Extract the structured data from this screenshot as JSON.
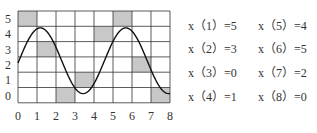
{
  "chart_data": {
    "type": "line",
    "title": "",
    "xlabel": "",
    "ylabel": "",
    "x_ticks": [
      "0",
      "1",
      "2",
      "3",
      "4",
      "5",
      "6",
      "7",
      "8"
    ],
    "y_ticks": [
      "0",
      "1",
      "2",
      "3",
      "4",
      "5"
    ],
    "xlim": [
      0,
      8
    ],
    "ylim": [
      0,
      6
    ],
    "grid": true,
    "curve": {
      "description": "sinusoidal curve",
      "points": [
        [
          0,
          2.7
        ],
        [
          1.2,
          4.9
        ],
        [
          3.5,
          0.6
        ],
        [
          5.7,
          4.9
        ],
        [
          8,
          0.5
        ]
      ]
    },
    "shaded_cells": [
      {
        "index": 1,
        "col": 0,
        "row": 5
      },
      {
        "index": 2,
        "col": 1,
        "row": 3
      },
      {
        "index": 3,
        "col": 2,
        "row": 0
      },
      {
        "index": 4,
        "col": 3,
        "row": 1
      },
      {
        "index": 5,
        "col": 4,
        "row": 4
      },
      {
        "index": 6,
        "col": 5,
        "row": 5
      },
      {
        "index": 7,
        "col": 6,
        "row": 2
      },
      {
        "index": 8,
        "col": 7,
        "row": 0
      }
    ],
    "samples": [
      {
        "n": 1,
        "value": 5
      },
      {
        "n": 2,
        "value": 3
      },
      {
        "n": 3,
        "value": 0
      },
      {
        "n": 4,
        "value": 1
      },
      {
        "n": 5,
        "value": 4
      },
      {
        "n": 6,
        "value": 5
      },
      {
        "n": 7,
        "value": 2
      },
      {
        "n": 8,
        "value": 0
      }
    ]
  },
  "equations": [
    {
      "label": "x（1）=5"
    },
    {
      "label": "x（2）=3"
    },
    {
      "label": "x（3）=0"
    },
    {
      "label": "x（4）=1"
    },
    {
      "label": "x（5）=4"
    },
    {
      "label": "x（6）=5"
    },
    {
      "label": "x（7）=2"
    },
    {
      "label": "x（8）=0"
    }
  ],
  "colors": {
    "shade": "#c8c8c8",
    "grid": "#333333",
    "curve": "#111111"
  }
}
